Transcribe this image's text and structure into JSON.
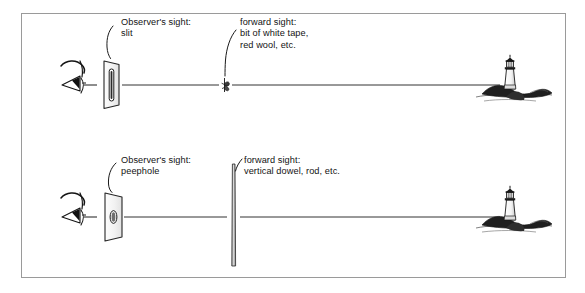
{
  "figure": {
    "width": 585,
    "height": 293,
    "background_color": "#ffffff",
    "border_color": "#9a9a9a",
    "ink_color": "#131313"
  },
  "panels": [
    {
      "id": "upper",
      "observer_label": "Observer's sight:\nslit",
      "forward_label": "forward sight:\nbit of white tape,\nred wool, etc.",
      "observer_device": "slit-plate",
      "forward_device": "tape-knot-marker",
      "target": "lighthouse"
    },
    {
      "id": "lower",
      "observer_label": "Observer's sight:\npeephole",
      "forward_label": "forward sight:\nvertical dowel, rod, etc.",
      "observer_device": "peephole-plate",
      "forward_device": "vertical-dowel",
      "target": "lighthouse"
    }
  ],
  "icons": {
    "eye": "eye-icon",
    "slit_plate": "slit-plate-icon",
    "peephole_plate": "peephole-plate-icon",
    "tape_marker": "tape-knot-icon",
    "dowel": "vertical-dowel-icon",
    "lighthouse": "lighthouse-icon",
    "leader": "leader-line-icon",
    "sight_line": "sight-line-icon"
  }
}
